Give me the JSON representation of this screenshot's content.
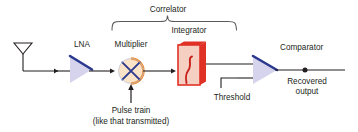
{
  "figure": {
    "kind": "block-diagram",
    "title_group_label": "Correlator",
    "background_color": "#ffffff",
    "text_color": "#231f20"
  },
  "labels": {
    "correlator": "Correlator",
    "lna": "LNA",
    "multiplier": "Multiplier",
    "integrator": "Integrator",
    "comparator": "Comparator",
    "pulse_train_line1": "Pulse train",
    "pulse_train_line2": "(like that transmitted)",
    "threshold": "Threshold",
    "recovered_line1": "Recovered",
    "recovered_line2": "output"
  },
  "icons": {
    "antenna": "antenna-icon",
    "amplifier": "triangle-amplifier-icon",
    "mixer": "circle-x-mixer-icon",
    "integrator": "integral-sign-icon",
    "comparator": "triangle-comparator-icon",
    "threshold": "step-level-icon",
    "node_dot": "junction-dot-icon",
    "brace": "curly-brace-icon"
  },
  "colors": {
    "wire": "#231f20",
    "amp_edge": "#2b3a8f",
    "amp_fill": "#d6d4ec",
    "mixer_arc": "#f08a2a",
    "mixer_x": "#2b3a8f",
    "mixer_fill": "#fbe3c8",
    "integrator_box_fill": "#f6cfc3",
    "integrator_box_edge": "#e03127",
    "integrator_glyph": "#c8201a",
    "brace": "#58595b",
    "text": "#231f20"
  }
}
